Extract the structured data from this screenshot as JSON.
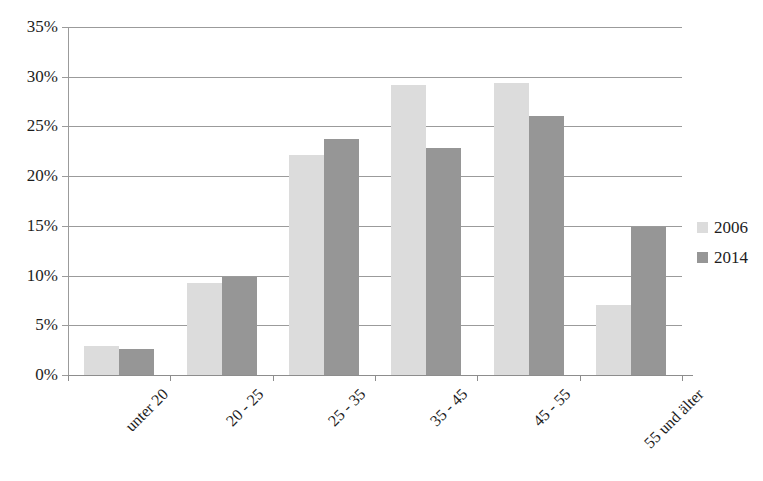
{
  "chart_data": {
    "type": "bar",
    "title": "",
    "subtitle": "",
    "xlabel": "",
    "ylabel": "",
    "categories": [
      "unter 20",
      "20 - 25",
      "25 - 35",
      "35 - 45",
      "45 - 55",
      "55 und älter"
    ],
    "series": [
      {
        "name": "2006",
        "color": "#dcdcdc",
        "values": [
          2.9,
          9.3,
          22.1,
          29.2,
          29.4,
          7.0
        ]
      },
      {
        "name": "2014",
        "color": "#969696",
        "values": [
          2.6,
          9.9,
          23.7,
          22.8,
          26.1,
          14.9
        ]
      }
    ],
    "ylim": [
      0,
      35
    ],
    "ytick_values": [
      0,
      5,
      10,
      15,
      20,
      25,
      30,
      35
    ],
    "ytick_labels": [
      "0%",
      "5%",
      "10%",
      "15%",
      "20%",
      "25%",
      "30%",
      "35%"
    ],
    "grid": true,
    "grid_axis": "y",
    "legend_position": "right",
    "legend_entries": [
      "2006",
      "2014"
    ],
    "annotations": []
  }
}
